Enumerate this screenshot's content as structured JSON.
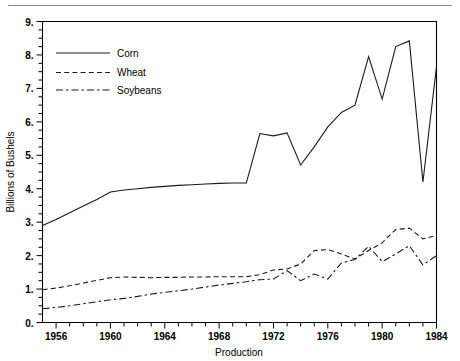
{
  "header": {
    "top_fragment": "·",
    "rule_color": "#8a8a8a"
  },
  "chart_data": {
    "type": "line",
    "title": "",
    "xlabel": "Production",
    "ylabel": "Billions of Bushels",
    "xlim": [
      1955,
      1984
    ],
    "ylim": [
      0,
      9
    ],
    "grid": false,
    "legend_position": "top-left",
    "x_tick_labels": [
      "1956",
      "1960",
      "1964",
      "1968",
      "1972",
      "1976",
      "1980",
      "1984"
    ],
    "x_tick_values": [
      1956,
      1960,
      1964,
      1968,
      1972,
      1976,
      1980,
      1984
    ],
    "x_minor_step": 1,
    "y_tick_labels": [
      "0.",
      "1.",
      "2.",
      "3.",
      "4.",
      "5.",
      "6.",
      "7.",
      "8.",
      "9."
    ],
    "y_tick_values": [
      0,
      1,
      2,
      3,
      4,
      5,
      6,
      7,
      8,
      9
    ],
    "y_minor_step": 0.25,
    "x": [
      1955,
      1956,
      1957,
      1958,
      1959,
      1960,
      1961,
      1962,
      1963,
      1964,
      1965,
      1966,
      1967,
      1968,
      1969,
      1970,
      1971,
      1972,
      1973,
      1974,
      1975,
      1976,
      1977,
      1978,
      1979,
      1980,
      1981,
      1982,
      1983,
      1984
    ],
    "series": [
      {
        "name": "Corn",
        "style": "solid",
        "color": "#1a1a1a",
        "values": [
          2.9,
          3.08,
          3.28,
          3.48,
          3.68,
          3.9,
          3.96,
          4.0,
          4.04,
          4.07,
          4.1,
          4.12,
          4.14,
          4.16,
          4.17,
          4.17,
          5.65,
          5.58,
          5.67,
          4.71,
          5.25,
          5.85,
          6.28,
          6.5,
          7.95,
          6.68,
          8.25,
          8.42,
          4.2,
          7.65
        ]
      },
      {
        "name": "Wheat",
        "style": "dashed",
        "color": "#1a1a1a",
        "values": [
          0.98,
          1.03,
          1.1,
          1.18,
          1.26,
          1.34,
          1.36,
          1.35,
          1.34,
          1.35,
          1.35,
          1.36,
          1.36,
          1.37,
          1.37,
          1.37,
          1.43,
          1.57,
          1.6,
          1.75,
          2.15,
          2.18,
          2.05,
          1.9,
          2.15,
          2.38,
          2.78,
          2.82,
          2.5,
          2.6
        ]
      },
      {
        "name": "Soybeans",
        "style": "dashdot",
        "color": "#1a1a1a",
        "values": [
          0.41,
          0.45,
          0.5,
          0.56,
          0.62,
          0.68,
          0.72,
          0.78,
          0.85,
          0.9,
          0.95,
          1.0,
          1.06,
          1.12,
          1.17,
          1.22,
          1.28,
          1.3,
          1.55,
          1.25,
          1.45,
          1.3,
          1.78,
          1.88,
          2.28,
          1.82,
          2.05,
          2.3,
          1.72,
          2.0
        ]
      }
    ]
  },
  "legend": {
    "items": [
      {
        "label": "Corn",
        "style": "solid"
      },
      {
        "label": "Wheat",
        "style": "dashed"
      },
      {
        "label": "Soybeans",
        "style": "dashdot"
      }
    ]
  }
}
